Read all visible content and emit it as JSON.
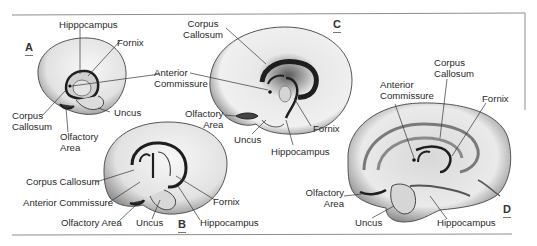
{
  "figure": {
    "panels": [
      {
        "id": "A",
        "letter": "A",
        "labels": {
          "hippocampus": "Hippocampus",
          "fornix": "Fornix",
          "anterior_commissure": [
            "Anterior",
            "Commissure"
          ],
          "corpus_callosum": [
            "Corpus",
            "Callosum"
          ],
          "olfactory_area": [
            "Olfactory",
            "Area"
          ],
          "uncus": "Uncus"
        }
      },
      {
        "id": "B",
        "letter": "B",
        "labels": {
          "corpus_callosum": "Corpus Callosum",
          "anterior_commissure": "Anterior Commissure",
          "olfactory_area": "Olfactory Area",
          "uncus": "Uncus",
          "fornix": "Fornix",
          "hippocampus": "Hippocampus"
        }
      },
      {
        "id": "C",
        "letter": "C",
        "labels": {
          "corpus_callosum": [
            "Corpus",
            "Callosum"
          ],
          "anterior_commissure": [
            "Anterior",
            "Commissure"
          ],
          "olfactory_area": [
            "Olfactory",
            "Area"
          ],
          "uncus": "Uncus",
          "fornix": "Fornix",
          "hippocampus": "Hippocampus"
        }
      },
      {
        "id": "D",
        "letter": "D",
        "labels": {
          "anterior_commissure": [
            "Anterior",
            "Commissure"
          ],
          "corpus_callosum": [
            "Corpus",
            "Callosum"
          ],
          "fornix": "Fornix",
          "olfactory_area": [
            "Olfactory",
            "Area"
          ],
          "uncus": "Uncus",
          "hippocampus": "Hippocampus"
        }
      }
    ],
    "colors": {
      "background": "#ffffff",
      "brain_fill": "#e9e9e9",
      "brain_shade": "#8a8a8a",
      "structure_dark": "#1e1e1e",
      "text": "#2a2a2a",
      "frame": "#8c8c8c"
    }
  }
}
